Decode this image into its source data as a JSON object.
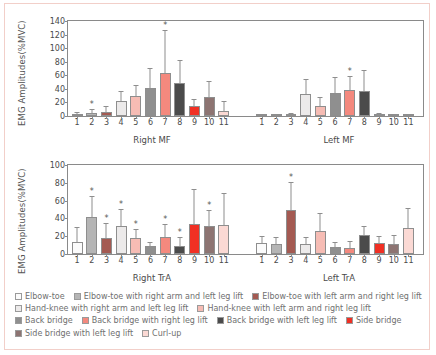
{
  "figure": {
    "border_color": "#f2cfc9",
    "axis_color": "#8a8a8a"
  },
  "legend": {
    "rows": [
      [
        {
          "label": "Elbow-toe",
          "color": "#fbfbfb"
        },
        {
          "label": "Elbow-toe with right arm and left leg lift",
          "color": "#b5b5b5"
        },
        {
          "label": "Elbow-toe with left arm and right leg lift",
          "color": "#a45a52"
        }
      ],
      [
        {
          "label": "Hand-knee with right arm and left leg lift",
          "color": "#eceaea"
        },
        {
          "label": "Hand-knee with left arm and right leg lift",
          "color": "#f6bcb4"
        }
      ],
      [
        {
          "label": "Back bridge",
          "color": "#8f8f8f"
        },
        {
          "label": "Back bridge with right leg lift",
          "color": "#f4897e"
        },
        {
          "label": "Back bridge with left leg lift",
          "color": "#4b4b4b"
        },
        {
          "label": "Side bridge",
          "color": "#f03024"
        }
      ],
      [
        {
          "label": "Side bridge with left leg lift",
          "color": "#8d7472"
        },
        {
          "label": "Curl-up",
          "color": "#fbd9d4"
        }
      ]
    ]
  },
  "chart_data": [
    {
      "type": "bar",
      "title": "",
      "xlabel": "",
      "ylabel": "EMG Amplitudes(%MVC)",
      "ylim": [
        0,
        140
      ],
      "yticks": [
        0,
        20,
        40,
        60,
        80,
        100,
        120,
        140
      ],
      "grid": false,
      "legend_position": "below-figure",
      "categories": [
        "1",
        "2",
        "3",
        "4",
        "5",
        "6",
        "7",
        "8",
        "9",
        "10",
        "11"
      ],
      "groups": [
        {
          "name": "Right MF",
          "values": [
            3.5,
            5.0,
            6.5,
            22.0,
            29.5,
            42.0,
            63.5,
            48.5,
            14.5,
            28.0,
            7.0
          ],
          "errors": [
            1.5,
            4.0,
            6.5,
            13.0,
            14.5,
            28.0,
            62.0,
            32.0,
            9.0,
            22.0,
            13.0
          ],
          "significant": [
            false,
            true,
            false,
            false,
            false,
            false,
            true,
            false,
            false,
            false,
            false
          ]
        },
        {
          "name": "Left MF",
          "values": [
            0.6,
            1.2,
            2.0,
            32.0,
            15.0,
            33.5,
            39.0,
            36.5,
            2.0,
            1.2,
            1.0
          ],
          "errors": [
            0.6,
            1.0,
            1.5,
            21.0,
            11.5,
            22.0,
            18.0,
            30.0,
            1.5,
            1.0,
            1.0
          ],
          "significant": [
            false,
            false,
            false,
            false,
            false,
            false,
            true,
            false,
            false,
            false,
            false
          ]
        }
      ]
    },
    {
      "type": "bar",
      "title": "",
      "xlabel": "",
      "ylabel": "EMG Amplitudes(%MVC)",
      "ylim": [
        0,
        100
      ],
      "yticks": [
        0,
        20,
        40,
        60,
        80,
        100
      ],
      "grid": false,
      "legend_position": "below-figure",
      "categories": [
        "1",
        "2",
        "3",
        "4",
        "5",
        "6",
        "7",
        "8",
        "9",
        "10",
        "11"
      ],
      "groups": [
        {
          "name": "Right TrA",
          "values": [
            13.5,
            42.0,
            17.5,
            31.5,
            18.0,
            8.5,
            19.0,
            9.5,
            33.5,
            31.5,
            32.5
          ],
          "errors": [
            16.0,
            22.0,
            16.0,
            18.0,
            9.0,
            3.5,
            14.0,
            8.5,
            38.0,
            17.0,
            35.0
          ],
          "significant": [
            false,
            true,
            true,
            true,
            true,
            false,
            true,
            true,
            false,
            true,
            false
          ]
        },
        {
          "name": "Left TrA",
          "values": [
            12.5,
            11.5,
            50.0,
            11.0,
            26.0,
            7.5,
            7.0,
            21.0,
            12.0,
            11.5,
            29.5
          ],
          "errors": [
            7.0,
            6.5,
            30.0,
            7.0,
            18.5,
            5.0,
            6.5,
            9.0,
            7.5,
            9.0,
            21.0
          ],
          "significant": [
            false,
            false,
            true,
            false,
            false,
            false,
            false,
            false,
            false,
            false,
            false
          ]
        }
      ]
    }
  ],
  "series_colors": [
    "#fbfbfb",
    "#b5b5b5",
    "#a45a52",
    "#eceaea",
    "#f6bcb4",
    "#8f8f8f",
    "#f4897e",
    "#4b4b4b",
    "#f03024",
    "#8d7472",
    "#fbd9d4"
  ]
}
